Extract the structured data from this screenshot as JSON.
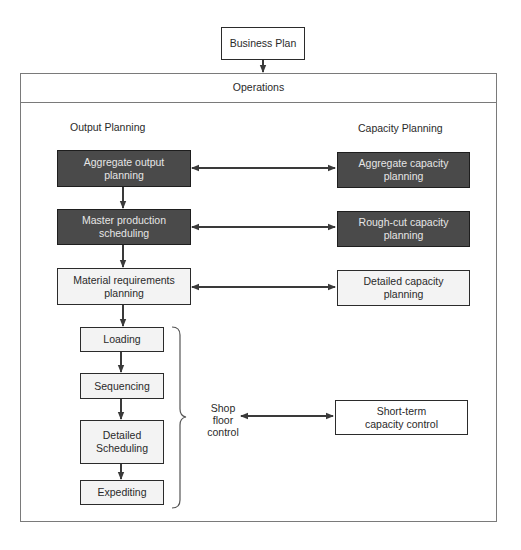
{
  "diagram": {
    "top": {
      "business_plan": "Business Plan",
      "operations": "Operations"
    },
    "columns": {
      "left_heading": "Output Planning",
      "right_heading": "Capacity Planning"
    },
    "output_planning": [
      {
        "id": "aggregate-output",
        "line1": "Aggregate output",
        "line2": "planning",
        "style": "dark"
      },
      {
        "id": "master-production",
        "line1": "Master production",
        "line2": "scheduling",
        "style": "dark"
      },
      {
        "id": "mrp",
        "line1": "Material requirements",
        "line2": "planning",
        "style": "light"
      }
    ],
    "capacity_planning": [
      {
        "id": "aggregate-capacity",
        "line1": "Aggregate capacity",
        "line2": "planning",
        "style": "dark"
      },
      {
        "id": "rough-cut",
        "line1": "Rough-cut capacity",
        "line2": "planning",
        "style": "dark"
      },
      {
        "id": "detailed-capacity",
        "line1": "Detailed capacity",
        "line2": "planning",
        "style": "light"
      }
    ],
    "shop_floor_steps": [
      {
        "id": "loading",
        "line1": "Loading",
        "line2": ""
      },
      {
        "id": "sequencing",
        "line1": "Sequencing",
        "line2": ""
      },
      {
        "id": "detailed-scheduling",
        "line1": "Detailed",
        "line2": "Scheduling"
      },
      {
        "id": "expediting",
        "line1": "Expediting",
        "line2": ""
      }
    ],
    "shop_floor_label": {
      "line1": "Shop",
      "line2": "floor",
      "line3": "control"
    },
    "short_term": {
      "line1": "Short-term",
      "line2": "capacity control"
    },
    "colors": {
      "dark_box_fill": "#4a4a4a",
      "dark_box_text": "#e6e6e6",
      "light_box_fill": "#f3f3f3",
      "line": "#3a3a3a",
      "frame": "#7a7a7a"
    }
  }
}
